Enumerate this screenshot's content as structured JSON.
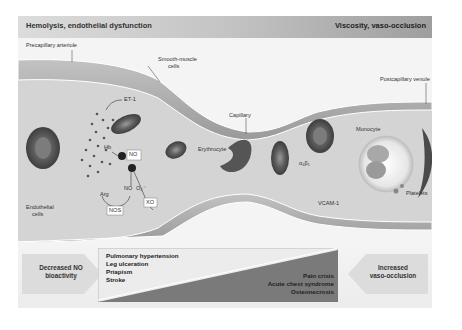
{
  "header": {
    "left_title": "Hemolysis, endothelial dysfunction",
    "right_title": "Viscosity, vaso-occlusion"
  },
  "labels": {
    "precapillary_arteriole": "Precapillary arteriole",
    "smooth_muscle_cells_line1": "Smooth-muscle",
    "smooth_muscle_cells_line2": "cells",
    "capillary": "Capillary",
    "postcapillary_venule": "Postcapillary venule",
    "et1": "ET-1",
    "hb": "Hb",
    "no_top": "NO",
    "no_bottom": "NO",
    "o2": "O₂⁻",
    "arg": "Arg",
    "nos": "NOS",
    "xo": "XO",
    "endothelial_cells_line1": "Endothelial",
    "endothelial_cells_line2": "cells",
    "erythrocyte": "Erythrocyte",
    "integrin": "α₄β₁",
    "monocyte": "Monocyte",
    "vcam1": "VCAM-1",
    "platelets": "Platelets"
  },
  "bottom_panel": {
    "left_arrow_line1": "Decreased NO",
    "left_arrow_line2": "bioactivity",
    "right_arrow_line1": "Increased",
    "right_arrow_line2": "vaso-occlusion",
    "left_conditions": [
      "Pulmonary hypertension",
      "Leg ulceration",
      "Priapism",
      "Stroke"
    ],
    "right_conditions": [
      "Pain crisis",
      "Acute chest syndrome",
      "Osteonecrosis"
    ]
  },
  "colors": {
    "header_dark": "#9e9e9e",
    "header_light": "#dcdcdc",
    "vessel_wall": "#a9a9a9",
    "lumen": "#d6d6d6",
    "cell": "#6e6e6e",
    "triangle_dark": "#7a7a7a",
    "triangle_light": "#ececec"
  }
}
